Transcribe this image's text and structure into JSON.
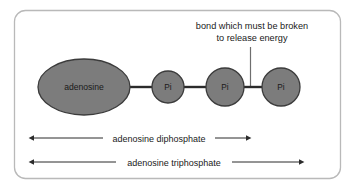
{
  "figure": {
    "border_color": "#b9b9b9",
    "background": "#ffffff",
    "node_fill": "#7c7c7c",
    "node_stroke": "#3b3b3b",
    "line_color": "#2b2b2b",
    "text_color": "#1a1a1a"
  },
  "annotation": {
    "line1": "bond which must be broken",
    "line2": "to release energy",
    "pointer_icon": "leader-line"
  },
  "nodes": [
    {
      "id": "adenosine",
      "label": "adenosine",
      "shape": "ellipse",
      "cx": 84,
      "cy": 87,
      "rx": 46,
      "ry": 28
    },
    {
      "id": "pi-1",
      "label": "Pi",
      "shape": "circle",
      "cx": 168,
      "cy": 87,
      "r": 16
    },
    {
      "id": "pi-2",
      "label": "Pi",
      "shape": "circle",
      "cx": 225,
      "cy": 87,
      "r": 19
    },
    {
      "id": "pi-3",
      "label": "Pi",
      "shape": "circle",
      "cx": 281,
      "cy": 87,
      "r": 19
    }
  ],
  "bonds": [
    {
      "id": "bond-adenosine-pi1",
      "x1": 130,
      "x2": 152,
      "y": 87
    },
    {
      "id": "bond-pi1-pi2",
      "x1": 184,
      "x2": 206,
      "y": 87
    },
    {
      "id": "bond-pi2-pi3",
      "x1": 244,
      "x2": 262,
      "y": 87,
      "highlighted": true
    }
  ],
  "measures": [
    {
      "id": "adp",
      "label": "adenosine diphosphate",
      "x1": 33,
      "x2": 247,
      "y": 138
    },
    {
      "id": "atp",
      "label": "adenosine triphosphate",
      "x1": 33,
      "x2": 300,
      "y": 162
    }
  ]
}
